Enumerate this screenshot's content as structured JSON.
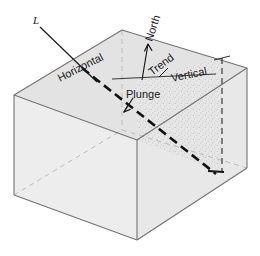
{
  "figure": {
    "type": "geologic-block-diagram",
    "background_color": "#ffffff",
    "ink_color": "#1a1a1a"
  },
  "labels": {
    "lineation": "L",
    "horizontal": "Horizontal",
    "north": "North",
    "trend": "Trend",
    "vertical": "Vertical",
    "plunge": "Plunge"
  },
  "colors": {
    "top_face": "#e3e3e3",
    "left_face": "#ededed",
    "right_face": "#e8e8e8",
    "stipple_plane": "#e6e6e6",
    "edge": "#6f6f6f",
    "hidden_edge": "#b6b6b6",
    "lineation": "#111111",
    "text": "#1a1a1a"
  },
  "geometry": {
    "block_corners": {
      "top_back": [
        122,
        30
      ],
      "top_left": [
        14,
        95
      ],
      "top_front": [
        137,
        140
      ],
      "top_right": [
        247,
        68
      ],
      "bottom_left": [
        14,
        195
      ],
      "bottom_front": [
        137,
        240
      ],
      "bottom_right": [
        247,
        168
      ]
    },
    "lineation_line": {
      "start": [
        82,
        72
      ],
      "end": [
        215,
        175
      ],
      "style": "heavy-dashed"
    },
    "horizontal_reference": {
      "start": [
        113,
        78
      ],
      "end": [
        214,
        78
      ],
      "style": "thin-solid"
    },
    "vertical_reference": {
      "top": [
        222,
        58
      ],
      "bottom": [
        222,
        172
      ],
      "style": "thin-dashed"
    },
    "north_arrow": {
      "tail": [
        143,
        78
      ],
      "head": [
        149,
        44
      ]
    },
    "stipple_plane_corners": [
      [
        137,
        80
      ],
      [
        222,
        58
      ],
      [
        222,
        172
      ],
      [
        137,
        140
      ]
    ]
  },
  "annotations": {
    "lineation_leader": {
      "from": [
        39,
        26
      ],
      "to": [
        96,
        82
      ]
    },
    "plunge_tick": {
      "from": [
        131,
        101
      ],
      "to": [
        122,
        114
      ]
    },
    "trend_tick": {
      "from": [
        170,
        70
      ],
      "to": [
        160,
        79
      ]
    }
  }
}
